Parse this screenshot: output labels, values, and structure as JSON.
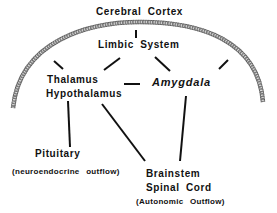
{
  "diagram": {
    "nodes": {
      "cerebral_cortex": "Cerebral  Cortex",
      "limbic_system": "Limbic  System",
      "thalamus": "Thalamus",
      "hypothalamus": "Hypothalamus",
      "amygdala": "Amygdala",
      "pituitary": "Pituitary",
      "pituitary_note": "(neuroendocrine  outflow)",
      "brainstem": "Brainstem",
      "spinal_cord": "Spinal  Cord",
      "brainstem_note": "(Autonomic  Outflow)"
    },
    "edges": [
      [
        "Cerebral Cortex",
        "Limbic System"
      ],
      [
        "Cerebral Cortex",
        "Thalamus/Hypothalamus"
      ],
      [
        "Cerebral Cortex",
        "Amygdala"
      ],
      [
        "Limbic System",
        "Thalamus/Hypothalamus"
      ],
      [
        "Limbic System",
        "Amygdala"
      ],
      [
        "Thalamus/Hypothalamus",
        "Amygdala"
      ],
      [
        "Thalamus/Hypothalamus",
        "Pituitary"
      ],
      [
        "Thalamus/Hypothalamus",
        "Brainstem/Spinal Cord"
      ],
      [
        "Amygdala",
        "Brainstem/Spinal Cord"
      ]
    ],
    "colors": {
      "ink": "#111111",
      "arc": "#555555",
      "background": "#ffffff"
    }
  }
}
